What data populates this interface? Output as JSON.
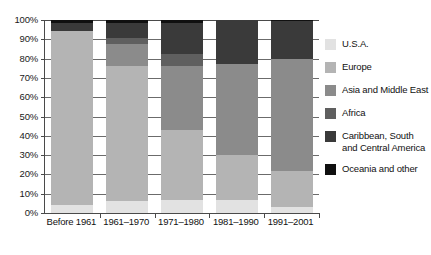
{
  "chart_data": {
    "type": "bar",
    "subtype": "stacked-100-percent",
    "title": "",
    "xlabel": "",
    "ylabel": "",
    "ylim": [
      0,
      100
    ],
    "yticks": [
      "0%",
      "10%",
      "20%",
      "30%",
      "40%",
      "50%",
      "60%",
      "70%",
      "80%",
      "90%",
      "100%"
    ],
    "grid": true,
    "legend_position": "right",
    "categories": [
      "Before 1961",
      "1961–1970",
      "1971–1980",
      "1981–1990",
      "1991–2001"
    ],
    "series": [
      {
        "name": "U.S.A.",
        "color": "#e2e2e2",
        "values": [
          4.0,
          6.0,
          7.0,
          7.0,
          3.0
        ]
      },
      {
        "name": "Europe",
        "color": "#b4b4b4",
        "values": [
          90.5,
          70.0,
          36.0,
          23.0,
          19.0
        ]
      },
      {
        "name": "Asia and Middle East",
        "color": "#8b8b8b",
        "values": [
          0.0,
          11.5,
          33.0,
          47.0,
          58.0
        ]
      },
      {
        "name": "Africa",
        "color": "#5f5f5f",
        "values": [
          0.0,
          3.0,
          6.5,
          0.0,
          0.0
        ]
      },
      {
        "name": "Caribbean, South and Central America",
        "color": "#3a3a3a",
        "values": [
          4.0,
          8.0,
          16.0,
          23.0,
          19.5
        ]
      },
      {
        "name": "Oceania and other",
        "color": "#101010",
        "values": [
          1.5,
          1.5,
          1.5,
          0.0,
          0.5
        ]
      }
    ]
  },
  "legend": {
    "items": [
      {
        "label": "U.S.A.",
        "label_line2": ""
      },
      {
        "label": "Europe",
        "label_line2": ""
      },
      {
        "label": "Asia and Middle East",
        "label_line2": ""
      },
      {
        "label": "Africa",
        "label_line2": ""
      },
      {
        "label": "Caribbean, South",
        "label_line2": "and Central America"
      },
      {
        "label": "Oceania and other",
        "label_line2": ""
      }
    ]
  }
}
